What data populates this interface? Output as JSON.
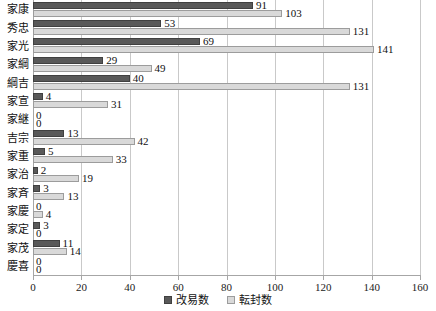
{
  "chart_data": {
    "type": "bar",
    "orientation": "horizontal",
    "title": "",
    "xlabel": "",
    "ylabel": "",
    "xlim": [
      0,
      160
    ],
    "xticks": [
      0,
      20,
      40,
      60,
      80,
      100,
      120,
      140,
      160
    ],
    "grid": true,
    "legend_position": "bottom",
    "categories": [
      "家康",
      "秀忠",
      "家光",
      "家綱",
      "綱吉",
      "家宣",
      "家継",
      "吉宗",
      "家重",
      "家治",
      "家斉",
      "家慶",
      "家定",
      "家茂",
      "慶喜"
    ],
    "series": [
      {
        "name": "改易数",
        "color": "#595959",
        "values": [
          91,
          53,
          69,
          29,
          40,
          4,
          0,
          13,
          5,
          2,
          3,
          0,
          3,
          11,
          0
        ]
      },
      {
        "name": "転封数",
        "color": "#d9d9d9",
        "values": [
          103,
          131,
          141,
          49,
          131,
          31,
          0,
          42,
          33,
          19,
          13,
          4,
          0,
          14,
          0
        ]
      }
    ]
  },
  "legend": {
    "items": [
      {
        "label": "改易数",
        "swatch": "dark"
      },
      {
        "label": "転封数",
        "swatch": "light"
      }
    ]
  }
}
